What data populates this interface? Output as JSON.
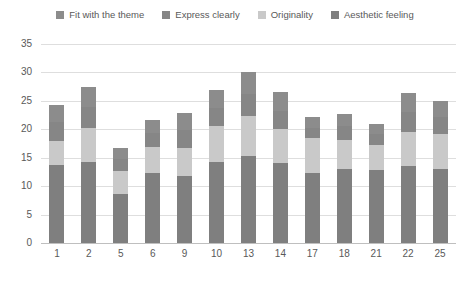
{
  "chart_data": {
    "type": "bar",
    "subtype": "stacked-bar",
    "title": "",
    "xlabel": "",
    "ylabel": "",
    "ylim": [
      0,
      35
    ],
    "ytick_values": [
      0,
      5,
      10,
      15,
      20,
      25,
      30,
      35
    ],
    "ytick_labels": [
      "0",
      "5",
      "10",
      "15",
      "20",
      "25",
      "30",
      "35"
    ],
    "grid": true,
    "legend_position": "top",
    "categories": [
      "1",
      "2",
      "5",
      "6",
      "9",
      "10",
      "13",
      "14",
      "17",
      "18",
      "21",
      "22",
      "25"
    ],
    "series": [
      {
        "name": "Aesthetic feeling",
        "color": "#7f7f7f",
        "values": [
          13.8,
          14.2,
          8.6,
          12.3,
          11.8,
          14.3,
          15.3,
          14.0,
          12.4,
          13.0,
          12.9,
          13.5,
          13.1
        ]
      },
      {
        "name": "Originality",
        "color": "#c9c9c9",
        "values": [
          4.2,
          6.0,
          4.0,
          4.6,
          5.0,
          6.3,
          7.0,
          6.0,
          6.0,
          5.2,
          4.3,
          6.1,
          6.0
        ]
      },
      {
        "name": "Express clearly",
        "color": "#868686",
        "values": [
          3.2,
          3.7,
          2.1,
          2.4,
          3.0,
          3.2,
          3.9,
          3.3,
          1.9,
          2.3,
          1.9,
          3.4,
          3.0
        ]
      },
      {
        "name": "Fit with the theme",
        "color": "#8c8c8c",
        "values": [
          3.1,
          3.6,
          2.0,
          2.3,
          3.0,
          3.2,
          3.8,
          3.2,
          1.9,
          2.2,
          1.8,
          3.4,
          2.9
        ]
      }
    ],
    "totals": [
      24.3,
      27.5,
      16.7,
      21.6,
      22.8,
      27.0,
      30.0,
      26.5,
      22.2,
      22.7,
      20.9,
      26.4,
      25.0
    ]
  },
  "legend": {
    "items": [
      {
        "label": "Fit with the theme",
        "color": "#8c8c8c",
        "icon": "legend-square-icon"
      },
      {
        "label": "Express clearly",
        "color": "#868686",
        "icon": "legend-square-icon"
      },
      {
        "label": "Originality",
        "color": "#c9c9c9",
        "icon": "legend-square-icon"
      },
      {
        "label": "Aesthetic feeling",
        "color": "#7f7f7f",
        "icon": "legend-square-icon"
      }
    ]
  },
  "colors": {
    "grid": "#dedede",
    "axis": "#bfbfbf",
    "text": "#595959",
    "background": "#ffffff"
  }
}
